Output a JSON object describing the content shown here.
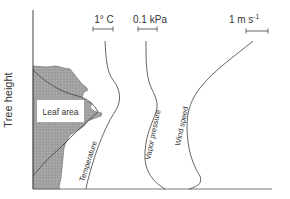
{
  "diagram": {
    "y_axis_label": "Tree height",
    "leaf_area_label": "Leaf area",
    "curves": [
      {
        "name": "Temperature",
        "scale_label": "1° C"
      },
      {
        "name": "Vapor pressure",
        "scale_label": "0.1 kPa"
      },
      {
        "name": "Wind speed",
        "scale_label": "1 m s-1"
      }
    ],
    "scale_bars": {
      "temperature": "1° C",
      "vapor_pressure": "0.1 kPa",
      "wind_speed_main": "1 m s",
      "wind_speed_sup": "-1"
    },
    "colors": {
      "line": "#555555",
      "leaf_fill": "#9a9a9a",
      "axis": "#444444"
    }
  }
}
